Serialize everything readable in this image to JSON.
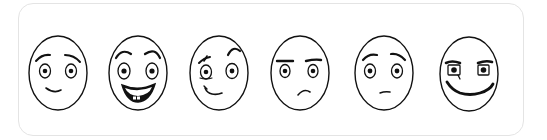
{
  "card": {
    "border_color": "#e4e4e4",
    "background": "#ffffff"
  },
  "faces": [
    {
      "id": "worried-smile",
      "expression": "worried smile",
      "cx": 58,
      "cy": 73
    },
    {
      "id": "big-grin",
      "expression": "big happy grin",
      "cx": 138,
      "cy": 73
    },
    {
      "id": "skeptical",
      "expression": "skeptical smirk",
      "cx": 219,
      "cy": 73
    },
    {
      "id": "annoyed",
      "expression": "annoyed frown",
      "cx": 300,
      "cy": 73
    },
    {
      "id": "concerned",
      "expression": "concerned neutral",
      "cx": 384,
      "cy": 73
    },
    {
      "id": "scheming",
      "expression": "scheming grin",
      "cx": 469,
      "cy": 73
    }
  ],
  "colors": {
    "line": "#111111",
    "face_fill": "#ffffff"
  }
}
